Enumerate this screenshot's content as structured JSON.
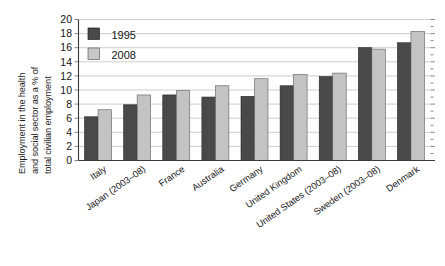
{
  "chart_data": {
    "type": "bar",
    "title": "",
    "subtitle": "",
    "xlabel": "",
    "ylabel": "Employment in the health and social sector as a % of total civilian employment",
    "ylabel_lines": [
      "Employment in the health",
      "and social sector as a % of",
      "total civilian employment"
    ],
    "categories": [
      "Italy",
      "Japan (2003–08)",
      "France",
      "Australia",
      "Germany",
      "United Kingdom",
      "United States (2003–08)",
      "Sweden (2003–08)",
      "Denmark"
    ],
    "series": [
      {
        "name": "1995",
        "color": "#494949",
        "values": [
          6.2,
          7.9,
          9.3,
          9.0,
          9.1,
          10.6,
          11.9,
          16.0,
          16.7
        ]
      },
      {
        "name": "2008",
        "color": "#c3c3c3",
        "values": [
          7.2,
          9.3,
          9.9,
          10.6,
          11.6,
          12.2,
          12.4,
          15.8,
          18.3
        ]
      }
    ],
    "ylim": [
      0,
      20
    ],
    "yticks": [
      0,
      2,
      4,
      6,
      8,
      10,
      12,
      14,
      16,
      18,
      20
    ],
    "ytick_labels": [
      "0",
      "2",
      "4",
      "6",
      "8",
      "10",
      "12",
      "14",
      "16",
      "18",
      "20"
    ],
    "grid": true,
    "grid_axis": "y",
    "legend": [
      "1995",
      "2008"
    ],
    "legend_position": "top-left-inside",
    "xlabel_rotation": -35
  },
  "axis": {
    "y_title_line1": "Employment in the health",
    "y_title_line2": "and social sector as a % of",
    "y_title_line3": "total civilian employment"
  },
  "legend": {
    "item_1_label": "1995",
    "item_2_label": "2008"
  }
}
